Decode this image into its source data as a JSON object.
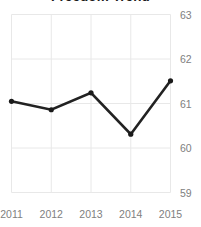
{
  "chart_data": {
    "type": "line",
    "title": "Freedom Trend",
    "xlabel": "",
    "ylabel": "",
    "categories": [
      "2011",
      "2012",
      "2013",
      "2014",
      "2015"
    ],
    "x": [
      2011,
      2012,
      2013,
      2014,
      2015
    ],
    "values": [
      61.05,
      60.86,
      61.24,
      60.31,
      61.51
    ],
    "series": [
      {
        "name": "Freedom Score",
        "values": [
          61.05,
          60.86,
          61.24,
          60.31,
          61.51
        ]
      }
    ],
    "ylim": [
      59,
      63
    ],
    "xlim": [
      2011,
      2015
    ],
    "yticks": [
      59,
      60,
      61,
      62,
      63
    ],
    "ytick_labels": [
      "59",
      "60",
      "61",
      "62",
      "63"
    ],
    "xticks": [
      2011,
      2012,
      2013,
      2014,
      2015
    ],
    "xtick_labels": [
      "2011",
      "2012",
      "2013",
      "2014",
      "2015"
    ],
    "grid": true,
    "grid_axes": "both",
    "legend": false,
    "legend_position": "none",
    "y_axis_side": "right",
    "markers": true,
    "annotations": [],
    "colors": {
      "line": "#222222",
      "marker": "#1a1a1a",
      "grid": "#e8e8e8",
      "axis_text": "#808080",
      "title_text": "#1a1a1a",
      "background": "#ffffff"
    }
  }
}
